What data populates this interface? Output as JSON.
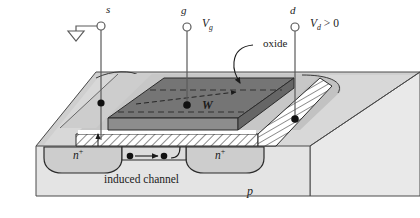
{
  "figure": {
    "name": "n-channel MOSFET 3D cutaway",
    "background": "#ffffff",
    "colors": {
      "substrate_top": "#d6d6d6",
      "substrate_front": "#e2e2e2",
      "substrate_side": "#ececec",
      "gate_dark": "#6f6f6f",
      "gate_mid": "#8a8a8a",
      "channel_dark": "#7d7d7d",
      "oxide_fill": "#ffffff",
      "nplus_fill": "#cfcfcf",
      "outline": "#2b2b2b",
      "lead": "#555555"
    }
  },
  "terminals": [
    {
      "id": "source",
      "label": "s",
      "name": "source-terminal",
      "has_ground": true,
      "voltage_label": ""
    },
    {
      "id": "gate",
      "label": "g",
      "name": "gate-terminal",
      "has_ground": false,
      "voltage_label": "V",
      "voltage_sub": "g",
      "voltage_rest": ""
    },
    {
      "id": "drain",
      "label": "d",
      "name": "drain-terminal",
      "has_ground": false,
      "voltage_label": "V",
      "voltage_sub": "d",
      "voltage_rest": " > 0"
    }
  ],
  "annotations": {
    "oxide": "oxide",
    "width": "W",
    "induced_channel": "induced channel",
    "nplus_source": "n",
    "nplus_source_sup": "+",
    "nplus_drain": "n",
    "nplus_drain_sup": "+",
    "substrate": "p"
  },
  "voltages": {
    "gate": {
      "symbol": "V",
      "subscript": "g",
      "relation": ""
    },
    "drain": {
      "symbol": "V",
      "subscript": "d",
      "relation": " > 0"
    }
  }
}
